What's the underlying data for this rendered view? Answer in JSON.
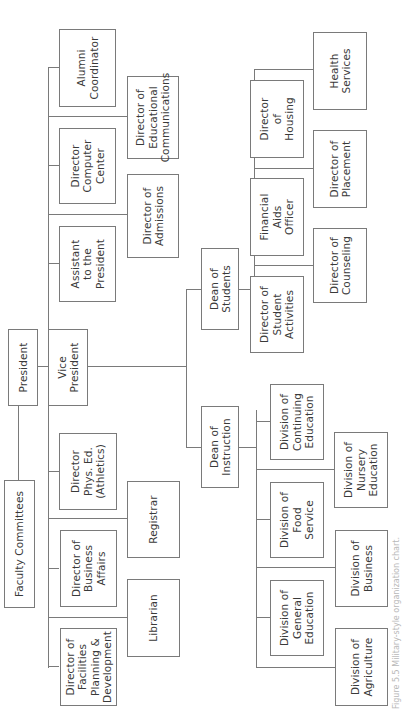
{
  "chart": {
    "orientation": "rotated 90deg counter-clockwise",
    "line_color": "#7a7a7a",
    "text_color": "#3a3a3a",
    "caption": "Figure 5.5 Military-style organization chart.",
    "nodes": {
      "faculty_committees": "Faculty Committees",
      "president": "President",
      "vice_president": "Vice\nPresident",
      "alumni_coordinator": "Alumni\nCoordinator",
      "director_computer_center": "Director\nComputer\nCenter",
      "assistant_to_president": "Assistant\nto the\nPresident",
      "director_phys_ed": "Director\nPhys. Ed.\n(Athletics)",
      "director_business_affairs": "Director of\nBusiness\nAffairs",
      "director_facilities": "Director of\nFacilities\nPlanning &\nDevelopment",
      "director_educational_communications": "Director of\nEducational\nCommunications",
      "director_admissions": "Director of\nAdmissions",
      "registrar": "Registrar",
      "librarian": "Librarian",
      "dean_of_students": "Dean of\nStudents",
      "dean_of_instruction": "Dean of\nInstruction",
      "director_housing": "Director\nof\nHousing",
      "financial_aids_officer": "Financial\nAids\nOfficer",
      "director_student_activities": "Director of\nStudent\nActivities",
      "health_services": "Health\nServices",
      "director_placement": "Director of\nPlacement",
      "director_counseling": "Director of\nCounseling",
      "division_continuing_education": "Division of\nContinuing\nEducation",
      "division_food_service": "Division of\nFood\nService",
      "division_general_education": "Division of\nGeneral\nEducation",
      "division_nursery_education": "Division of\nNursery\nEducation",
      "division_business": "Division of\nBusiness",
      "division_agriculture": "Division of\nAgriculture"
    },
    "hierarchy": {
      "Faculty Committees": [
        "President"
      ],
      "President": [
        "Vice President"
      ],
      "Vice President": [
        "Alumni Coordinator",
        "Director Computer Center",
        "Assistant to the President",
        "Director Phys. Ed. (Athletics)",
        "Director of Business Affairs",
        "Director of Facilities Planning & Development",
        "Director of Educational Communications",
        "Director of Admissions",
        "Registrar",
        "Librarian",
        "Dean of Students",
        "Dean of Instruction"
      ],
      "Dean of Students": [
        "Director of Housing",
        "Financial Aids Officer",
        "Director of Student Activities",
        "Health Services",
        "Director of Placement",
        "Director of Counseling"
      ],
      "Dean of Instruction": [
        "Division of Continuing Education",
        "Division of Food Service",
        "Division of General Education",
        "Division of Nursery Education",
        "Division of Business",
        "Division of Agriculture"
      ]
    }
  }
}
